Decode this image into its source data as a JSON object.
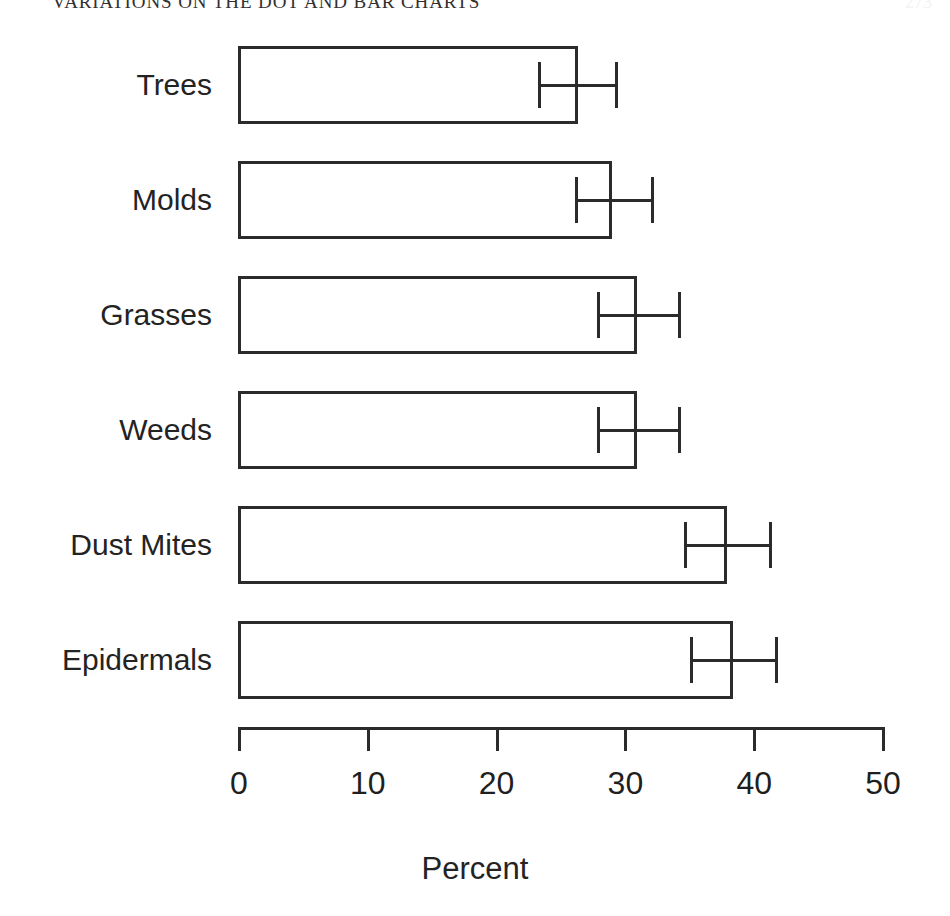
{
  "page": {
    "running_head": "VARIATIONS ON THE DOT AND BAR CHARTS",
    "folio": "273"
  },
  "chart_data": {
    "type": "bar",
    "orientation": "horizontal",
    "title": "",
    "subtitle": "",
    "xlabel": "Percent",
    "ylabel": "",
    "categories": [
      "Trees",
      "Molds",
      "Grasses",
      "Weeds",
      "Dust Mites",
      "Epidermals"
    ],
    "values": [
      26.4,
      29.0,
      31.0,
      31.0,
      38.0,
      38.4
    ],
    "error_low": [
      23.3,
      26.2,
      27.9,
      27.9,
      34.6,
      35.1
    ],
    "error_high": [
      29.3,
      32.1,
      34.2,
      34.2,
      41.2,
      41.7
    ],
    "xlim": [
      0,
      50
    ],
    "xticks": [
      0,
      10,
      20,
      30,
      40,
      50
    ],
    "xticklabels": [
      "0",
      "10",
      "20",
      "30",
      "40",
      "50"
    ],
    "grid": false,
    "legend": false,
    "bar_fill": "none",
    "bar_edge_color": "#2b2b2b",
    "error_bar_color": "#2b2b2b",
    "background_color": "#ffffff"
  }
}
